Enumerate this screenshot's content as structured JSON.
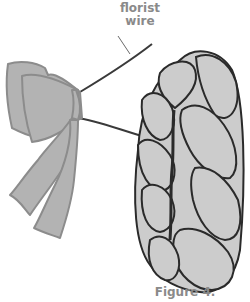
{
  "figure": {
    "labels": {
      "florist_line1": "florist",
      "florist_line2": "wire"
    },
    "caption": "Figure 4.",
    "colors": {
      "bow_fill": "#b3b3b3",
      "bow_stroke": "#8c8c8c",
      "braid_fill": "#cccccc",
      "braid_stroke": "#2a2a2a",
      "wire": "#3a3a3a",
      "label_text": "#8a8a8a"
    }
  }
}
